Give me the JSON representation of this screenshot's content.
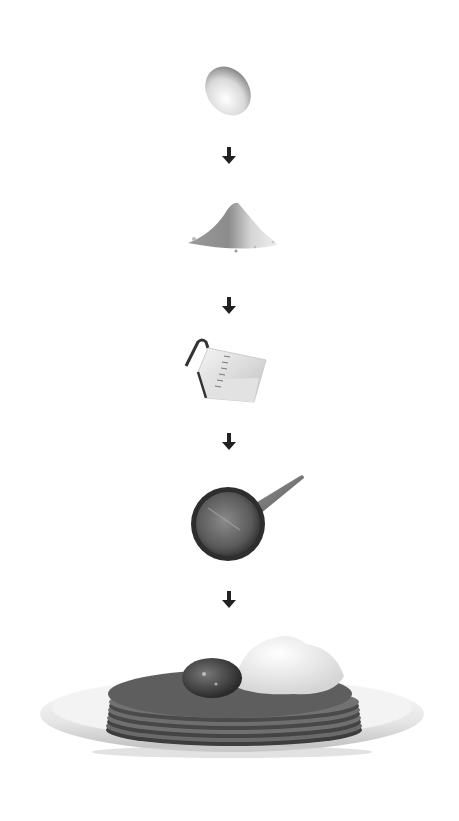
{
  "diagram": {
    "type": "process-flow",
    "direction": "top-to-bottom",
    "steps": [
      {
        "name": "egg",
        "icon": "egg-icon"
      },
      {
        "name": "flour",
        "icon": "flour-pile-icon"
      },
      {
        "name": "milk",
        "icon": "measuring-jug-icon"
      },
      {
        "name": "frying pan",
        "icon": "frying-pan-icon"
      },
      {
        "name": "pancakes",
        "icon": "pancake-stack-icon"
      }
    ],
    "connectors": [
      {
        "from": "egg",
        "to": "flour",
        "icon": "arrow-down-icon"
      },
      {
        "from": "flour",
        "to": "milk",
        "icon": "arrow-down-icon"
      },
      {
        "from": "milk",
        "to": "frying pan",
        "icon": "arrow-down-icon"
      },
      {
        "from": "frying pan",
        "to": "pancakes",
        "icon": "arrow-down-icon"
      }
    ]
  },
  "colors": {
    "background": "#ffffff",
    "arrow": "#222222",
    "pancake": "#4a4a4a",
    "plate": "#e8e8e8",
    "pan": "#555555"
  }
}
